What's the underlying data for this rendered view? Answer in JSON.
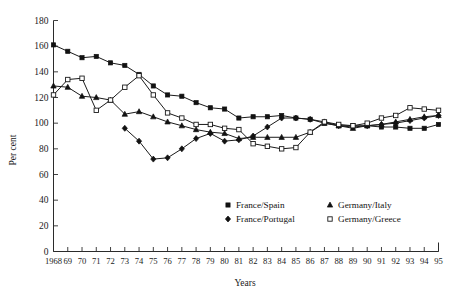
{
  "chart_data": {
    "type": "line",
    "title": "",
    "xlabel": "Years",
    "ylabel": "Per cent",
    "ylim": [
      0,
      180
    ],
    "ytick_step": 20,
    "yticks": [
      0,
      20,
      40,
      60,
      80,
      100,
      120,
      140,
      160,
      180
    ],
    "grid": false,
    "legend_position": "inside-bottom-center",
    "x": [
      1968,
      1969,
      1970,
      1971,
      1972,
      1973,
      1974,
      1975,
      1976,
      1977,
      1978,
      1979,
      1980,
      1981,
      1982,
      1983,
      1984,
      1985,
      1986,
      1987,
      1988,
      1989,
      1990,
      1991,
      1992,
      1993,
      1994,
      1995
    ],
    "xtick_labels": [
      "1968",
      "69",
      "70",
      "71",
      "72",
      "73",
      "74",
      "75",
      "76",
      "77",
      "78",
      "79",
      "80",
      "81",
      "82",
      "83",
      "84",
      "85",
      "86",
      "87",
      "88",
      "89",
      "90",
      "91",
      "92",
      "93",
      "94",
      "95"
    ],
    "series": [
      {
        "name": "France/Spain",
        "marker": "filled-square",
        "values": [
          161,
          156,
          151,
          152,
          147,
          145,
          138,
          129,
          122,
          121,
          116,
          112,
          111,
          104,
          105,
          105,
          106,
          104,
          103,
          100,
          98,
          98,
          98,
          97,
          97,
          96,
          96,
          99
        ]
      },
      {
        "name": "France/Portugal",
        "marker": "filled-diamond",
        "values": [
          null,
          null,
          null,
          null,
          null,
          96,
          86,
          72,
          73,
          80,
          88,
          92,
          86,
          87,
          90,
          97,
          104,
          104,
          103,
          101,
          98,
          97,
          98,
          99,
          100,
          102,
          104,
          106
        ]
      },
      {
        "name": "Germany/Italy",
        "marker": "filled-triangle",
        "values": [
          129,
          128,
          121,
          120,
          118,
          107,
          109,
          105,
          101,
          98,
          95,
          93,
          92,
          88,
          89,
          89,
          89,
          89,
          93,
          100,
          98,
          96,
          98,
          99,
          101,
          103,
          105,
          106
        ]
      },
      {
        "name": "Germany/Greece",
        "marker": "open-square",
        "values": [
          122,
          134,
          135,
          110,
          118,
          128,
          137,
          122,
          108,
          104,
          99,
          99,
          96,
          95,
          84,
          82,
          80,
          81,
          93,
          101,
          99,
          98,
          100,
          104,
          106,
          112,
          111,
          110
        ]
      }
    ]
  },
  "legend": {
    "entries": [
      {
        "label": "France/Spain",
        "marker": "filled-square"
      },
      {
        "label": "France/Portugal",
        "marker": "filled-diamond"
      },
      {
        "label": "Germany/Italy",
        "marker": "filled-triangle"
      },
      {
        "label": "Germany/Greece",
        "marker": "open-square"
      }
    ]
  },
  "colors": {
    "ink": "#1a1a1a",
    "marker_fill": "#121212",
    "marker_open_fill": "#ffffff",
    "background": "#ffffff"
  }
}
